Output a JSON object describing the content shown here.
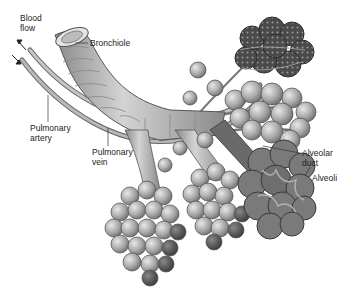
{
  "diagram": {
    "labels": {
      "blood_flow": "Blood\nflow",
      "bronchiole": "Bronchiole",
      "pulmonary_artery": "Pulmonary\nartery",
      "pulmonary_vein": "Pulmonary\nvein",
      "alveolar_duct": "Alveolar\nduct",
      "alveoli": "Alveoli"
    },
    "colors": {
      "background": "#ffffff",
      "tissue_light": "#c8c8c8",
      "tissue_mid": "#9a9a9a",
      "tissue_dark": "#555555",
      "outline": "#444444",
      "text": "#222222"
    }
  }
}
